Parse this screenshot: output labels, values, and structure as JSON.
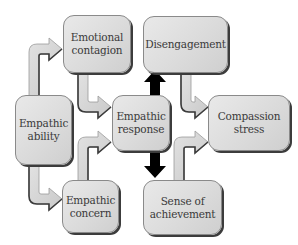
{
  "nodes": {
    "emotional_contagion": {
      "line1": "Emotional",
      "line2": "contagion"
    },
    "empathic_ability": {
      "line1": "Empathic",
      "line2": "ability"
    },
    "empathic_response": {
      "line1": "Empathic",
      "line2": "response"
    },
    "empathic_concern": {
      "line1": "Empathic",
      "line2": "concern"
    },
    "disengagement": {
      "line1": "Disengagement"
    },
    "compassion_stress": {
      "line1": "Compassion",
      "line2": "stress"
    },
    "sense_of_achievement": {
      "line1": "Sense of",
      "line2": "achievement"
    }
  },
  "edges": [
    {
      "from": "Empathic ability",
      "to": "Emotional contagion",
      "style": "grey-pipe-arrow"
    },
    {
      "from": "Empathic ability",
      "to": "Empathic concern",
      "style": "grey-pipe-arrow"
    },
    {
      "from": "Emotional contagion",
      "to": "Empathic response",
      "style": "grey-pipe-arrow"
    },
    {
      "from": "Empathic concern",
      "to": "Empathic response",
      "style": "grey-pipe-arrow"
    },
    {
      "from": "Empathic response",
      "to": "Disengagement",
      "style": "black-arrow"
    },
    {
      "from": "Empathic response",
      "to": "Sense of achievement",
      "style": "black-arrow"
    },
    {
      "from": "Disengagement",
      "to": "Compassion stress",
      "style": "grey-pipe-arrow"
    },
    {
      "from": "Sense of achievement",
      "to": "Compassion stress",
      "style": "grey-pipe-arrow"
    }
  ],
  "colors": {
    "node_fill": "#dcdcdc",
    "node_border": "#8a8a8a",
    "node_shadow": "#3c3c3c",
    "text": "#3a3a3a",
    "pipe_fill": "#d4d4d4",
    "pipe_shadow": "#3c3c3c",
    "black_arrow": "#000000"
  }
}
